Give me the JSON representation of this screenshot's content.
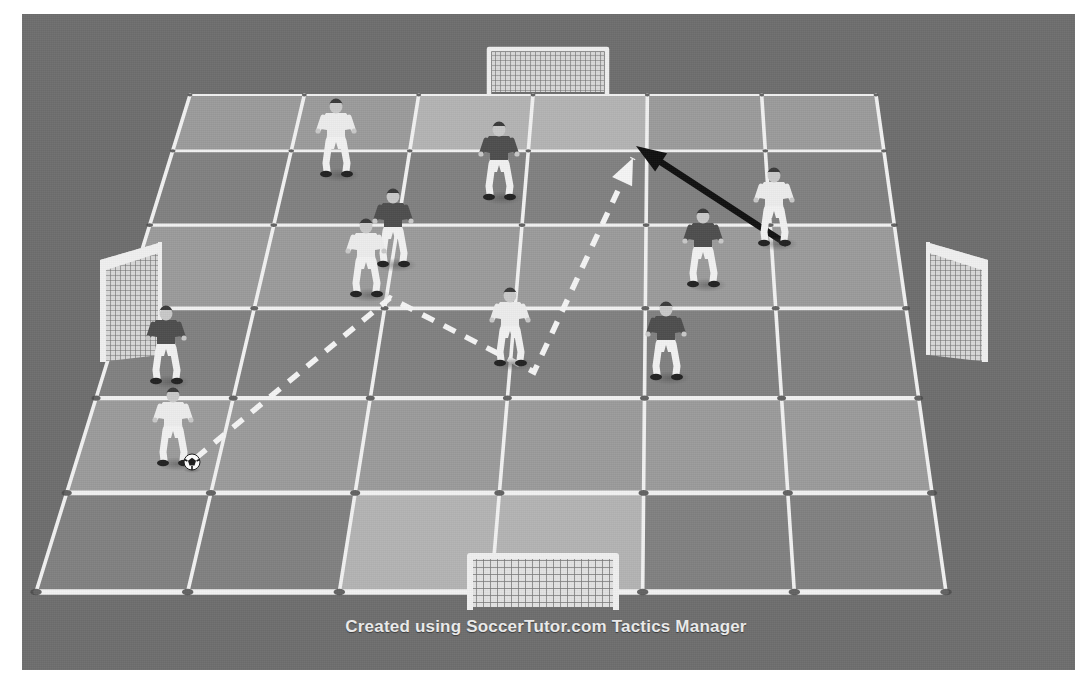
{
  "caption": {
    "text": "Created using SoccerTutor.com Tactics Manager"
  },
  "colors": {
    "background_gray": "#6e6e6e",
    "page_white": "#ffffff",
    "grid_line": "#f2f2f2",
    "node_marker": "#4a4a4a",
    "cell_light": "#9b9b9b",
    "cell_dark": "#818181",
    "cell_highlight": "#b4b4b4",
    "goal_white": "#f0f0f0",
    "kit_white_shirt": "#ededed",
    "kit_dark_shirt": "#4e4e4e",
    "shorts_white": "#f2f2f2",
    "boot_dark": "#222222",
    "skin": "#c9c9c9",
    "hair_dark": "#3a3a3a",
    "run_arrow": "#101010",
    "pass_line": "#f5f5f5",
    "ball_white": "#ffffff",
    "ball_dark": "#1a1a1a"
  },
  "pitch": {
    "type": "perspective-grid",
    "columns": 6,
    "rows": 6,
    "corners": {
      "top_left": [
        190,
        95
      ],
      "top_right": [
        876,
        95
      ],
      "bottom_right": [
        946,
        592
      ],
      "bottom_left": [
        36,
        592
      ]
    },
    "shading_rows": [
      [
        "light",
        "light",
        "highlight",
        "highlight",
        "light",
        "light"
      ],
      [
        "dark",
        "dark",
        "dark",
        "dark",
        "dark",
        "dark"
      ],
      [
        "light",
        "light",
        "light",
        "light",
        "light",
        "light"
      ],
      [
        "dark",
        "dark",
        "dark",
        "dark",
        "dark",
        "dark"
      ],
      [
        "light",
        "light",
        "light",
        "light",
        "light",
        "light"
      ],
      [
        "dark",
        "dark",
        "highlight",
        "highlight",
        "dark",
        "dark"
      ]
    ]
  },
  "goals": [
    {
      "id": "goal-top",
      "label": "top-goal",
      "x": 548,
      "y": 72,
      "width": 118,
      "height": 46,
      "orientation": "horizontal-far"
    },
    {
      "id": "goal-bottom",
      "label": "bottom-goal",
      "x": 543,
      "y": 583,
      "width": 146,
      "height": 54,
      "orientation": "horizontal-near"
    },
    {
      "id": "goal-left",
      "label": "left-goal",
      "x": 100,
      "y": 302,
      "width": 62,
      "height": 120,
      "orientation": "side-left"
    },
    {
      "id": "goal-right",
      "label": "right-goal",
      "x": 988,
      "y": 302,
      "width": 62,
      "height": 120,
      "orientation": "side-right"
    }
  ],
  "players": [
    {
      "id": "p1",
      "team": "white",
      "x": 336,
      "y": 133,
      "facing": "right",
      "has_ball": false
    },
    {
      "id": "p2",
      "team": "dark",
      "x": 499,
      "y": 156,
      "facing": "front",
      "has_ball": false
    },
    {
      "id": "p3",
      "team": "white",
      "x": 774,
      "y": 202,
      "facing": "back",
      "has_ball": false
    },
    {
      "id": "p4",
      "team": "dark",
      "x": 393,
      "y": 223,
      "facing": "front",
      "has_ball": false
    },
    {
      "id": "p5",
      "team": "white",
      "x": 366,
      "y": 253,
      "facing": "left",
      "has_ball": false
    },
    {
      "id": "p6",
      "team": "dark",
      "x": 703,
      "y": 243,
      "facing": "back",
      "has_ball": false
    },
    {
      "id": "p7",
      "team": "white",
      "x": 510,
      "y": 322,
      "facing": "front",
      "has_ball": false
    },
    {
      "id": "p8",
      "team": "dark",
      "x": 666,
      "y": 336,
      "facing": "left",
      "has_ball": false
    },
    {
      "id": "p9",
      "team": "dark",
      "x": 166,
      "y": 340,
      "facing": "front",
      "has_ball": false
    },
    {
      "id": "p10",
      "team": "white",
      "x": 173,
      "y": 422,
      "facing": "front",
      "has_ball": true
    }
  ],
  "ball": {
    "x": 192,
    "y": 462
  },
  "movements": {
    "pass_path": {
      "style": "dashed",
      "color": "#f5f5f5",
      "points": [
        [
          196,
          458
        ],
        [
          390,
          298
        ],
        [
          534,
          372
        ],
        [
          633,
          158
        ]
      ],
      "arrow_at_end": true,
      "arrow_direction": "up-left"
    },
    "run_arrow": {
      "style": "solid",
      "color": "#101010",
      "from": [
        785,
        243
      ],
      "to": [
        636,
        146
      ],
      "arrow_at_end": true
    }
  }
}
